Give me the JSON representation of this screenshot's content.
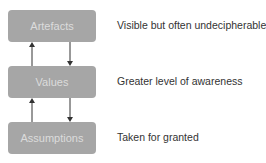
{
  "diagram": {
    "levels": [
      {
        "label": "Artefacts",
        "description": "Visible but often undecipherable"
      },
      {
        "label": "Values",
        "description": "Greater level of awareness"
      },
      {
        "label": "Assumptions",
        "description": "Taken for granted"
      }
    ],
    "colors": {
      "box_fill": "#a6a6a6",
      "box_text": "#dcdcdc",
      "arrow": "#333333",
      "description_text": "#333333"
    },
    "arrows": [
      {
        "from": "Values",
        "to": "Artefacts",
        "direction": "up"
      },
      {
        "from": "Artefacts",
        "to": "Values",
        "direction": "down"
      },
      {
        "from": "Assumptions",
        "to": "Values",
        "direction": "up"
      },
      {
        "from": "Values",
        "to": "Assumptions",
        "direction": "down"
      }
    ]
  }
}
